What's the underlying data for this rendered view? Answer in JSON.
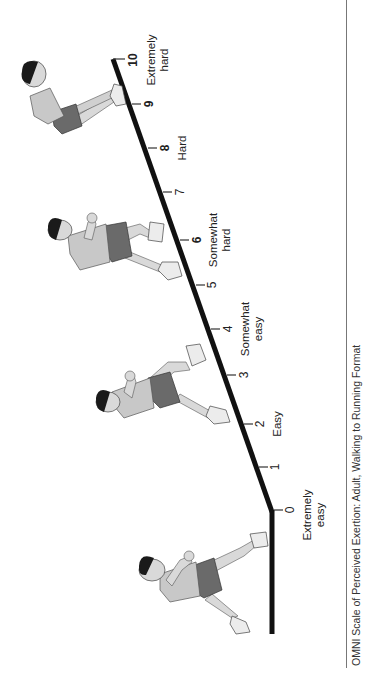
{
  "figure": {
    "caption": "OMNI Scale of Perceived Exertion: Adult, Walking to Running Format",
    "orientation": "rotated 90° counter-clockwise (reads bottom-to-top)"
  },
  "scale": {
    "ticks": [
      {
        "value": "0",
        "bold": false
      },
      {
        "value": "1",
        "bold": false
      },
      {
        "value": "2",
        "bold": true
      },
      {
        "value": "3",
        "bold": false
      },
      {
        "value": "4",
        "bold": false
      },
      {
        "value": "5",
        "bold": false
      },
      {
        "value": "6",
        "bold": true
      },
      {
        "value": "7",
        "bold": false
      },
      {
        "value": "8",
        "bold": true
      },
      {
        "value": "9",
        "bold": true
      },
      {
        "value": "10",
        "bold": true
      }
    ],
    "descriptors": [
      {
        "at": "0",
        "line1": "Extremely",
        "line2": "easy"
      },
      {
        "at": "2",
        "line1": "Easy",
        "line2": ""
      },
      {
        "at": "4",
        "line1": "Somewhat",
        "line2": "easy"
      },
      {
        "at": "6",
        "line1": "Somewhat",
        "line2": "hard"
      },
      {
        "at": "8",
        "line1": "Hard",
        "line2": ""
      },
      {
        "at": "10",
        "line1": "Extremely",
        "line2": "hard"
      }
    ]
  },
  "figures": [
    {
      "name": "walking-figure",
      "position": "level ground, before 0"
    },
    {
      "name": "jogging-figure",
      "position": "near 2"
    },
    {
      "name": "running-figure",
      "position": "near 6"
    },
    {
      "name": "exhausted-runner-figure",
      "position": "near 9-10"
    }
  ],
  "colors": {
    "line": "#111111",
    "text": "#222222",
    "skin": "#d9d9d9",
    "shirt": "#c8c8c8",
    "shorts": "#6a6a6a",
    "hair": "#1a1a1a",
    "separator": "#777777"
  }
}
